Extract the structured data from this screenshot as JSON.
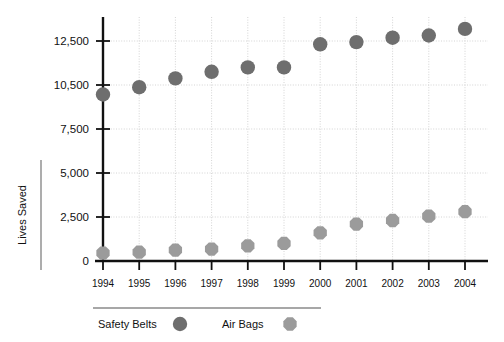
{
  "chart_data": {
    "type": "scatter",
    "title": "",
    "xlabel": "",
    "ylabel": "Lives Saved",
    "categories": [
      "1994",
      "1995",
      "1996",
      "1997",
      "1998",
      "1999",
      "2000",
      "2001",
      "2002",
      "2003",
      "2004"
    ],
    "ytick_labels": [
      "0",
      "2,500",
      "5,000",
      "7,500",
      "10,500",
      "12,500"
    ],
    "ytick_values": [
      0,
      2500,
      5000,
      7500,
      10500,
      12500
    ],
    "ylim": [
      0,
      13250
    ],
    "grid": true,
    "legend_position": "bottom",
    "series": [
      {
        "name": "Safety Belts",
        "marker": "circle",
        "color": "#6e6e6e",
        "values": [
          9850,
          10350,
          10800,
          11100,
          11300,
          11300,
          12350,
          12450,
          12650,
          12750,
          13050
        ]
      },
      {
        "name": "Air Bags",
        "marker": "octagon",
        "color": "#9b9b9b",
        "values": [
          450,
          500,
          620,
          680,
          860,
          1000,
          1600,
          2100,
          2300,
          2550,
          2800
        ]
      }
    ]
  },
  "legend": {
    "items": [
      {
        "label": "Safety Belts",
        "marker": "circle",
        "color": "#6e6e6e"
      },
      {
        "label": "Air Bags",
        "marker": "octagon",
        "color": "#9b9b9b"
      }
    ]
  },
  "axes": {
    "y_title": "Lives Saved",
    "axis_color": "#111111",
    "grid_color": "#cfcfcf"
  }
}
